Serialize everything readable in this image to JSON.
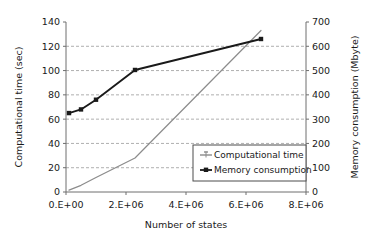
{
  "chart_data": {
    "type": "line",
    "title": "",
    "xlabel": "Number of states",
    "ylabel": "Computational time (sec)",
    "y2label": "Memory consumption (Mbyte)",
    "xlim": [
      0,
      8000000
    ],
    "ylim": [
      0,
      140
    ],
    "y2lim": [
      0,
      700
    ],
    "xticks": [
      0,
      2000000,
      4000000,
      6000000,
      8000000
    ],
    "xticklabels": [
      "0.E+00",
      "2.E+06",
      "4.E+06",
      "6.E+06",
      "8.E+06"
    ],
    "yticks": [
      0,
      20,
      40,
      60,
      80,
      100,
      120,
      140
    ],
    "yticklabels": [
      "0",
      "20",
      "40",
      "60",
      "80",
      "100",
      "120",
      "140"
    ],
    "y2ticks": [
      0,
      100,
      200,
      300,
      400,
      500,
      600,
      700
    ],
    "y2ticklabels": [
      "0",
      "100",
      "200",
      "300",
      "400",
      "500",
      "600",
      "700"
    ],
    "grid": true,
    "grid_axis": "y",
    "legend_position": "bottom-right",
    "series": [
      {
        "name": "Computational time",
        "axis": "left",
        "color": "#8c8c8c",
        "marker": "line",
        "x": [
          100000,
          500000,
          1000000,
          2300000,
          6500000
        ],
        "y": [
          1.5,
          5.5,
          12.0,
          28.0,
          133.0
        ]
      },
      {
        "name": "Memory consumption",
        "axis": "left",
        "color": "#1a1a1a",
        "marker": "square",
        "x": [
          100000,
          500000,
          1000000,
          2300000,
          6500000
        ],
        "y": [
          65.0,
          68.0,
          76.0,
          100.5,
          126.0
        ]
      }
    ],
    "legend": [
      {
        "label": "Computational time",
        "color": "#8c8c8c",
        "marker": "line"
      },
      {
        "label": "Memory consumption",
        "color": "#1a1a1a",
        "marker": "square"
      }
    ]
  }
}
